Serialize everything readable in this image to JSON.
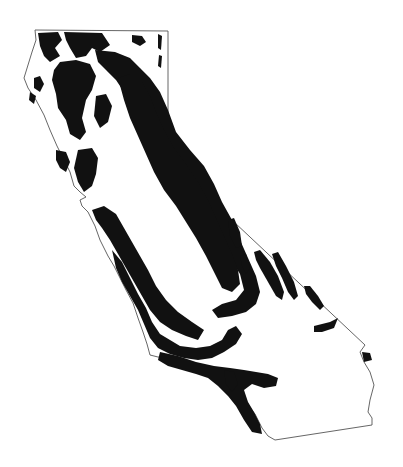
{
  "map": {
    "region": "California",
    "style": {
      "background": "#ffffff",
      "outline_color": "#555555",
      "fill_color": "#111111"
    },
    "outline_path": "M35,30 L168,31 L168,160 L365,345 L360,352 L364,362 L370,372 L374,385 L370,400 L368,412 L372,418 L372,425 L275,440 L268,436 L262,428 L255,414 L245,402 L232,392 L222,384 L212,372 L198,364 L183,360 L170,358 L158,357 L150,355 L147,344 L143,332 L138,318 L133,303 L126,290 L120,278 L114,266 L108,256 L100,240 L95,226 L88,212 L82,206 L80,200 L86,197 L80,192 L74,186 L70,172 L64,160 L57,146 L50,130 L44,115 L36,100 L28,88 L24,78 L28,65 L32,52 L36,40 Z",
    "distribution_paths": [
      "M38,33 L58,32 L62,40 L55,48 L60,56 L50,62 L44,56 L40,46 Z",
      "M64,32 L102,33 L110,45 L100,52 L92,48 L86,56 L76,58 L70,48 L66,40 Z",
      "M132,35 L142,36 L146,42 L140,46 L132,42 Z",
      "M158,34 L162,36 L161,50 L158,48 Z",
      "M159,55 L162,56 L161,68 L158,66 Z",
      "M60,62 L76,60 L90,64 L96,76 L92,90 L86,100 L82,118 L86,132 L80,140 L70,134 L66,120 L58,108 L56,94 L52,80 L54,70 Z",
      "M34,78 L40,76 L44,84 L40,92 L34,88 Z",
      "M30,92 L36,96 L34,104 L29,100 Z",
      "M95,50 L115,52 L130,58 L140,68 L150,78 L160,92 L168,110 L176,132 L190,150 L204,166 L214,184 L222,202 L232,220 L240,240 L248,258 L256,276 L260,292 L256,304 L246,312 L232,316 L218,318 L212,310 L222,304 L236,300 L244,290 L240,274 L230,258 L220,240 L208,222 L196,204 L184,188 L170,172 L158,156 L148,138 L138,122 L132,106 L124,92 L116,80 L106,70 L98,62 Z",
      "M118,78 L130,74 L142,82 L150,96 L156,112 L164,130 L174,148 L186,164 L198,182 L208,200 L216,218 L224,236 L232,254 L238,270 L240,284 L232,292 L222,288 L214,272 L206,256 L196,238 L186,222 L176,206 L164,190 L154,172 L146,154 L138,136 L130,118 L124,100 Z",
      "M96,96 L106,94 L112,106 L108,122 L100,128 L94,116 Z",
      "M78,150 L92,148 L98,158 L96,174 L92,186 L84,192 L78,182 L74,168 Z",
      "M56,150 L66,152 L70,162 L66,172 L60,168 L56,160 Z",
      "M92,210 L104,206 L116,214 L124,228 L132,242 L140,256 L148,270 L156,286 L166,300 L178,312 L192,322 L204,330 L198,340 L186,336 L172,330 L160,322 L150,310 L142,296 L134,282 L126,268 L118,254 L110,240 L102,228 L96,220 Z",
      "M112,250 L122,262 L130,278 L138,294 L146,308 L152,322 L160,334 L170,340 L180,346 L196,348 L210,346 L222,340 L228,330 L236,326 L242,334 L236,344 L224,352 L212,358 L198,360 L184,358 L170,354 L158,348 L150,338 L144,324 L138,310 L130,296 L122,282 L116,268 Z",
      "M160,352 L178,356 L196,362 L214,366 L230,368 L244,370 L256,372 L268,374 L278,378 L276,386 L264,388 L252,384 L244,390 L248,402 L254,412 L260,424 L262,434 L252,432 L244,420 L236,406 L228,396 L218,386 L208,378 L196,374 L182,370 L168,366 L158,360 Z",
      "M224,370 L234,372 L238,384 L232,392 L226,384 Z",
      "M228,220 L234,218 L240,232 L242,246 L236,248 L230,236 Z",
      "M240,256 L246,254 L250,268 L246,274 L242,266 Z",
      "M254,252 L260,250 L270,262 L278,276 L284,292 L282,300 L276,296 L268,282 L260,268 L256,260 Z",
      "M272,254 L278,252 L286,266 L294,282 L298,296 L294,300 L288,292 L282,278 L276,266 Z",
      "M304,286 L310,286 L318,296 L324,306 L320,310 L312,302 L306,294 Z",
      "M314,326 L330,322 L338,318 L334,328 L322,332 L314,332 Z",
      "M362,352 L370,353 L372,360 L364,362 Z"
    ]
  }
}
